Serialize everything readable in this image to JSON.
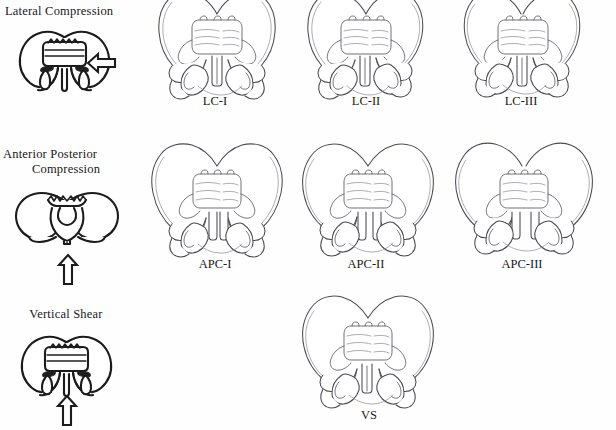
{
  "figure": {
    "background_color": "#ffffff",
    "ink_color": "#1b1b1b",
    "bone_line_color": "#4a4a52",
    "width": 616,
    "height": 430
  },
  "rows": [
    {
      "id": "lateral-compression",
      "mechanism_label": "Lateral Compression",
      "mechanism_label_lines": [
        "Lateral Compression"
      ],
      "force_arrow": {
        "icon": "block-arrow-left-icon",
        "direction": "left",
        "meaning": "lateral compressive force applied from the side"
      },
      "schematic": {
        "icon": "pelvis-schematic-lateral-compression-icon",
        "description": "narrow compressed pelvic ring seen from front"
      },
      "grades": [
        {
          "label": "LC-I",
          "column": 1
        },
        {
          "label": "LC-II",
          "column": 2
        },
        {
          "label": "LC-III",
          "column": 3
        }
      ]
    },
    {
      "id": "anterior-posterior-compression",
      "mechanism_label": "Anterior Posterior Compression",
      "mechanism_label_lines": [
        "Anterior Posterior",
        "Compression"
      ],
      "force_arrow": {
        "icon": "block-arrow-up-icon",
        "direction": "up",
        "meaning": "anteroposterior compressive force from the front"
      },
      "schematic": {
        "icon": "pelvis-schematic-open-book-icon",
        "description": "splayed open-book pelvic ring with widened symphysis"
      },
      "grades": [
        {
          "label": "APC-I",
          "column": 1
        },
        {
          "label": "APC-II",
          "column": 2
        },
        {
          "label": "APC-III",
          "column": 3
        }
      ]
    },
    {
      "id": "vertical-shear",
      "mechanism_label": "Vertical Shear",
      "mechanism_label_lines": [
        "Vertical Shear"
      ],
      "force_arrow": {
        "icon": "block-arrow-up-icon",
        "direction": "up",
        "meaning": "vertically directed shearing force"
      },
      "schematic": {
        "icon": "pelvis-schematic-vertical-shear-icon",
        "description": "pelvic ring with vertically displaced hemipelvis"
      },
      "grades": [
        {
          "label": "VS",
          "column": 2
        }
      ]
    }
  ],
  "pelvis_illustrations": [
    {
      "name": "pelvis-lc-1",
      "row": "lateral-compression",
      "caption": "LC-I"
    },
    {
      "name": "pelvis-lc-2",
      "row": "lateral-compression",
      "caption": "LC-II"
    },
    {
      "name": "pelvis-lc-3",
      "row": "lateral-compression",
      "caption": "LC-III"
    },
    {
      "name": "pelvis-apc-1",
      "row": "anterior-posterior-compression",
      "caption": "APC-I"
    },
    {
      "name": "pelvis-apc-2",
      "row": "anterior-posterior-compression",
      "caption": "APC-II"
    },
    {
      "name": "pelvis-apc-3",
      "row": "anterior-posterior-compression",
      "caption": "APC-III"
    },
    {
      "name": "pelvis-vs",
      "row": "vertical-shear",
      "caption": "VS"
    }
  ]
}
